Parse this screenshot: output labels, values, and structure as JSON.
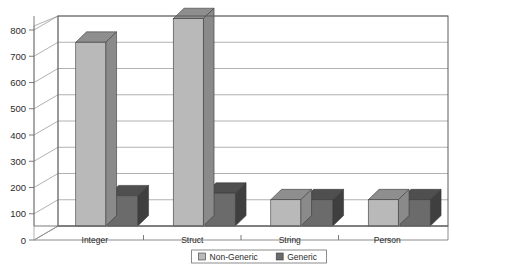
{
  "chart_data": {
    "type": "bar",
    "title": "",
    "subtitle": "",
    "xlabel": "",
    "ylabel": "",
    "categories": [
      "Integer",
      "Struct",
      "String",
      "Person"
    ],
    "series": [
      {
        "name": "Non-Generic",
        "values": [
          700,
          790,
          100,
          100
        ],
        "color": "#b9b9b9"
      },
      {
        "name": "Generic",
        "values": [
          115,
          125,
          100,
          100
        ],
        "color": "#6b6b6b"
      }
    ],
    "ylim": [
      0,
      800
    ],
    "yticks": [
      0,
      100,
      200,
      300,
      400,
      500,
      600,
      700,
      800
    ],
    "ytick_labels": [
      "0",
      "100",
      "200",
      "300",
      "400",
      "500",
      "600",
      "700",
      "800"
    ],
    "grid": true,
    "grid_axis": "y",
    "legend_position": "bottom",
    "three_d": true,
    "plot_background": "#ffffff",
    "grid_color": "#8f8f8f",
    "axis_color": "#707070",
    "border_color": "#5a5a5a"
  },
  "legend": {
    "entries": [
      {
        "label": "Non-Generic",
        "swatch": "#b9b9b9"
      },
      {
        "label": "Generic",
        "swatch": "#6b6b6b"
      }
    ]
  },
  "axes": {
    "y_tick_labels": [
      "800",
      "700",
      "600",
      "500",
      "400",
      "300",
      "200",
      "100",
      "0"
    ],
    "x_tick_labels": [
      "Integer",
      "Struct",
      "String",
      "Person"
    ]
  },
  "colors": {
    "bar_light_front": "#b9b9b9",
    "bar_light_top": "#8e8e8e",
    "bar_light_side": "#8a8a8a",
    "bar_dark_front": "#6b6b6b",
    "bar_dark_top": "#4f4f4f",
    "bar_dark_side": "#3f3f3f",
    "grid": "#8f8f8f",
    "frame": "#5a5a5a",
    "text": "#2b2b2b"
  }
}
